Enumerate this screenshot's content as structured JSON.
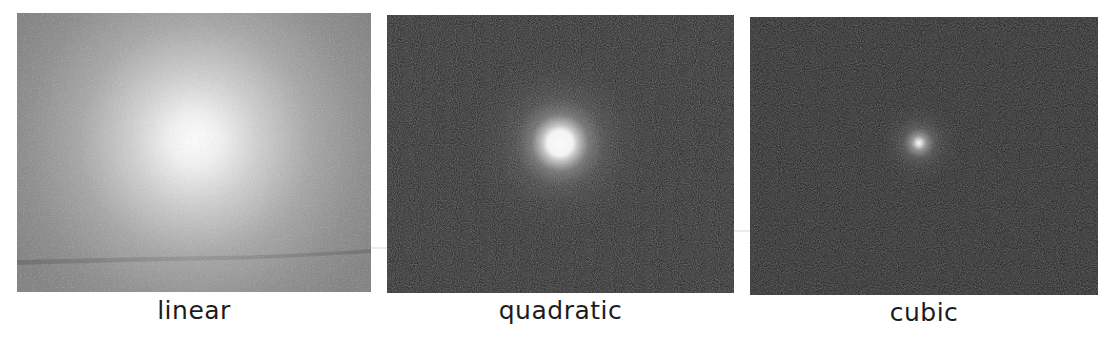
{
  "figure": {
    "panels": [
      {
        "id": "linear",
        "label": "linear",
        "background_color": "#8a8a8a",
        "center_color": "#fafafa",
        "glow_center_px": [
          178,
          127
        ],
        "glow_radius_px": 175
      },
      {
        "id": "quadratic",
        "label": "quadratic",
        "background_color": "#161616",
        "center_color": "#f8f8f8",
        "glow_center_px": [
          173,
          128
        ],
        "core_radius_px": 14,
        "glow_radius_px": 70
      },
      {
        "id": "cubic",
        "label": "cubic",
        "background_color": "#141414",
        "center_color": "#f0f0f0",
        "glow_center_px": [
          169,
          126
        ],
        "core_radius_px": 3,
        "glow_radius_px": 28
      }
    ]
  }
}
